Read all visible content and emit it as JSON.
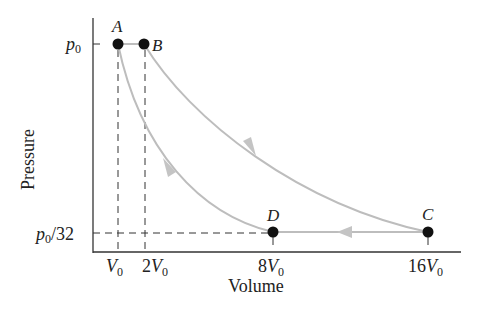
{
  "diagram": {
    "type": "pV-cycle",
    "axes": {
      "ylabel": "Pressure",
      "xlabel": "Volume",
      "yticks": [
        {
          "label_var": "p",
          "label_sub": "0",
          "label_suffix": "",
          "value": "p0"
        },
        {
          "label_var": "p",
          "label_sub": "0",
          "label_suffix": "/32",
          "value": "p0/32"
        }
      ],
      "xticks": [
        {
          "coef": "",
          "var": "V",
          "sub": "0",
          "value": "V0"
        },
        {
          "coef": "2",
          "var": "V",
          "sub": "0",
          "value": "2V0"
        },
        {
          "coef": "8",
          "var": "V",
          "sub": "0",
          "value": "8V0"
        },
        {
          "coef": "16",
          "var": "V",
          "sub": "0",
          "value": "16V0"
        }
      ]
    },
    "points": [
      {
        "name": "A",
        "V": "V0",
        "p": "p0"
      },
      {
        "name": "B",
        "V": "2V0",
        "p": "p0"
      },
      {
        "name": "C",
        "V": "16V0",
        "p": "p0/32"
      },
      {
        "name": "D",
        "V": "8V0",
        "p": "p0/32"
      }
    ],
    "paths": [
      {
        "from": "A",
        "to": "B",
        "kind": "isobaric"
      },
      {
        "from": "B",
        "to": "C",
        "kind": "curve",
        "arrow": "toward C"
      },
      {
        "from": "C",
        "to": "D",
        "kind": "isobaric",
        "arrow": "toward D"
      },
      {
        "from": "D",
        "to": "A",
        "kind": "curve",
        "arrow": "toward A"
      }
    ],
    "colors": {
      "axis": "#333333",
      "path": "#bdbdbd",
      "point": "#111111",
      "dashed": "#333333"
    }
  }
}
